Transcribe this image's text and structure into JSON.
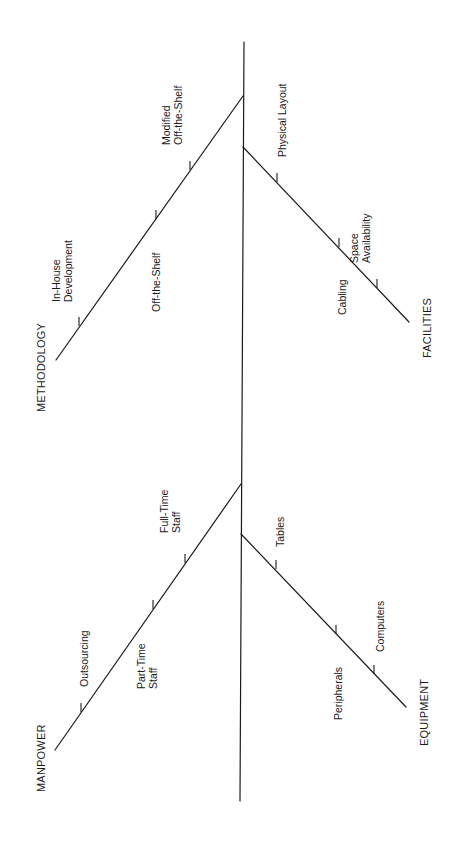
{
  "diagram": {
    "type": "fishbone",
    "orientation": "rotated-90-ccw",
    "stroke_color": "#1a1a1a",
    "background": "#ffffff",
    "spine": {
      "x1": 244,
      "y1": 42,
      "x2": 240,
      "y2": 801
    },
    "categories": [
      {
        "id": "methodology",
        "label": "METHODOLOGY",
        "side": "left",
        "bone": {
          "x1": 243,
          "y1": 96,
          "x2": 56,
          "y2": 360
        },
        "label_pos": {
          "x": 45,
          "y": 412
        },
        "causes": [
          {
            "lines": [
              "Modified",
              "Off-the-Shelf"
            ],
            "tick": {
              "x": 190,
              "y": 170
            },
            "text_x": 182,
            "text_y": 145
          },
          {
            "lines": [
              "Off-the-Shelf"
            ],
            "tick": {
              "x": 156,
              "y": 219
            },
            "text_x": 160,
            "text_y": 312
          },
          {
            "lines": [
              "In-House",
              "Development"
            ],
            "tick": {
              "x": 79,
              "y": 326
            },
            "text_x": 72,
            "text_y": 302
          }
        ]
      },
      {
        "id": "facilities",
        "label": "FACILITIES",
        "side": "right",
        "bone": {
          "x1": 243,
          "y1": 147,
          "x2": 409,
          "y2": 322
        },
        "label_pos": {
          "x": 431,
          "y": 358
        },
        "causes": [
          {
            "lines": [
              "Physical Layout"
            ],
            "tick": {
              "x": 277,
              "y": 182
            },
            "text_x": 286,
            "text_y": 157
          },
          {
            "lines": [
              "Cabling"
            ],
            "tick": {
              "x": 339,
              "y": 247
            },
            "text_x": 346,
            "text_y": 315
          },
          {
            "lines": [
              "Space",
              "Availability"
            ],
            "tick": {
              "x": 377,
              "y": 288
            },
            "text_x": 370,
            "text_y": 263
          }
        ]
      },
      {
        "id": "manpower",
        "label": "MANPOWER",
        "side": "left",
        "bone": {
          "x1": 241,
          "y1": 484,
          "x2": 55,
          "y2": 750
        },
        "label_pos": {
          "x": 45,
          "y": 792
        },
        "causes": [
          {
            "lines": [
              "Full-Time",
              "Staff"
            ],
            "tick": {
              "x": 185,
              "y": 563
            },
            "text_x": 180,
            "text_y": 533
          },
          {
            "lines": [
              "Part-Time",
              "Staff"
            ],
            "tick": {
              "x": 153,
              "y": 609
            },
            "text_x": 157,
            "text_y": 689
          },
          {
            "lines": [
              "Outsourcing"
            ],
            "tick": {
              "x": 81,
              "y": 712
            },
            "text_x": 88,
            "text_y": 687
          }
        ]
      },
      {
        "id": "equipment",
        "label": "EQUIPMENT",
        "side": "right",
        "bone": {
          "x1": 241,
          "y1": 534,
          "x2": 406,
          "y2": 707
        },
        "label_pos": {
          "x": 428,
          "y": 746
        },
        "causes": [
          {
            "lines": [
              "Tables"
            ],
            "tick": {
              "x": 276,
              "y": 569
            },
            "text_x": 284,
            "text_y": 547
          },
          {
            "lines": [
              "Peripherals"
            ],
            "tick": {
              "x": 336,
              "y": 634
            },
            "text_x": 342,
            "text_y": 720
          },
          {
            "lines": [
              "Computers"
            ],
            "tick": {
              "x": 374,
              "y": 674
            },
            "text_x": 384,
            "text_y": 652
          }
        ]
      }
    ]
  }
}
